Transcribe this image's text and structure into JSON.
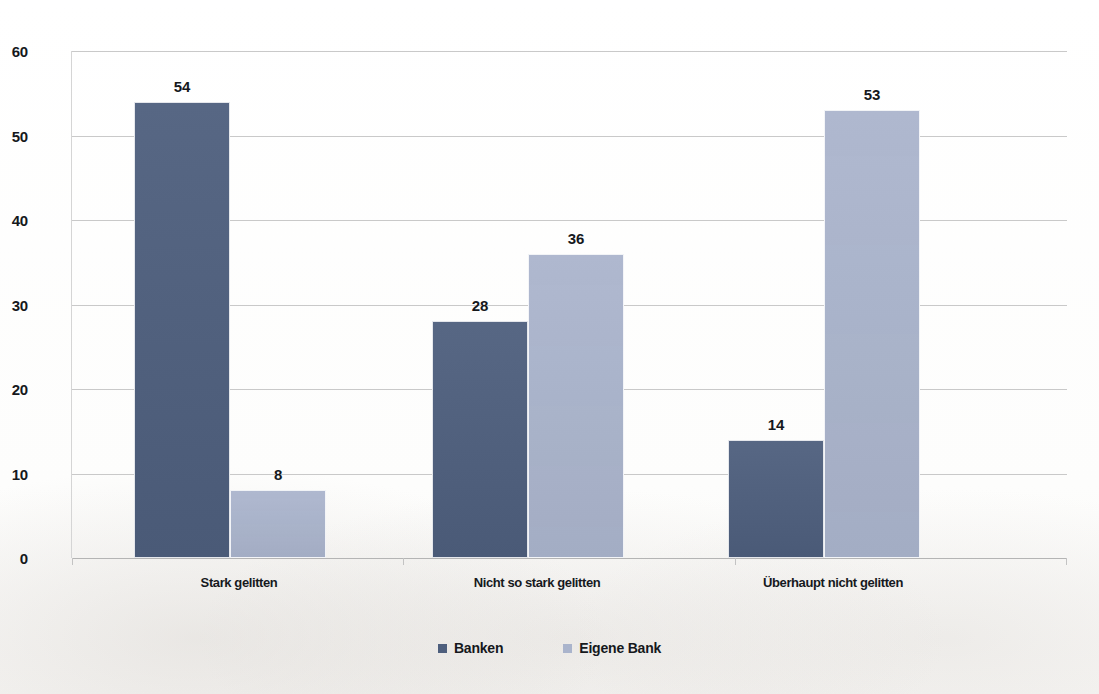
{
  "chart_data": {
    "type": "bar",
    "title": "",
    "subtitle": "",
    "xlabel": "",
    "ylabel": "",
    "ylim": [
      0,
      60
    ],
    "yticks": [
      0,
      10,
      20,
      30,
      40,
      50,
      60
    ],
    "grid": true,
    "legend_position": "bottom",
    "categories": [
      "Stark gelitten",
      "Nicht so stark gelitten",
      "Überhaupt nicht gelitten"
    ],
    "series": [
      {
        "name": "Banken",
        "color": "#4e5f7d",
        "values": [
          54,
          28,
          14
        ]
      },
      {
        "name": "Eigene Bank",
        "color": "#aab4cc",
        "values": [
          8,
          36,
          53
        ]
      }
    ],
    "data_labels": [
      [
        "54",
        "28",
        "14"
      ],
      [
        "8",
        "36",
        "53"
      ]
    ]
  },
  "axis": {
    "y_tick_labels": [
      "60",
      "50",
      "40",
      "30",
      "20",
      "10",
      "0"
    ]
  },
  "legend": {
    "items": [
      {
        "label": "Banken"
      },
      {
        "label": "Eigene Bank"
      }
    ]
  }
}
